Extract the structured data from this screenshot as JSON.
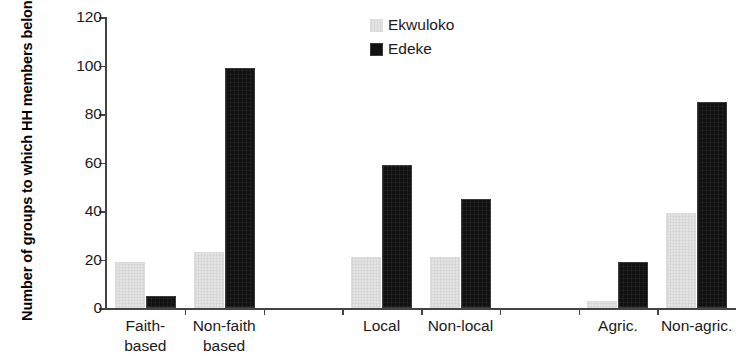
{
  "chart_data": {
    "type": "bar",
    "title": "",
    "xlabel": "",
    "ylabel": "Number of groups to which HH members belong",
    "ylim": [
      0,
      120
    ],
    "ytick_values": [
      0,
      20,
      40,
      60,
      80,
      100,
      120
    ],
    "ytick_labels": [
      "0",
      "20",
      "40",
      "60",
      "80",
      "100",
      "120"
    ],
    "grid": false,
    "legend_position": "top-center-right",
    "categories": [
      "Faith-based",
      "Non-faith based",
      "Local",
      "Non-local",
      "Agric.",
      "Non-agric."
    ],
    "category_label_lines": [
      [
        "Faith-",
        "based"
      ],
      [
        "Non-faith",
        "based"
      ],
      [
        "Local",
        ""
      ],
      [
        "Non-local",
        ""
      ],
      [
        "Agric.",
        ""
      ],
      [
        "Non-agric.",
        ""
      ]
    ],
    "series": [
      {
        "name": "Ekwuloko",
        "color": "#e3e3e3",
        "values": [
          19,
          23,
          21,
          21,
          3,
          39
        ]
      },
      {
        "name": "Edeke",
        "color": "#111111",
        "values": [
          5,
          99,
          59,
          45,
          19,
          85
        ]
      }
    ],
    "group_separators_after": [
      2,
      4
    ],
    "axis_color": "#444444"
  },
  "legend": {
    "items": [
      {
        "label": "Ekwuloko",
        "swatch": "ekwuloko"
      },
      {
        "label": "Edeke",
        "swatch": "edeke"
      }
    ]
  }
}
